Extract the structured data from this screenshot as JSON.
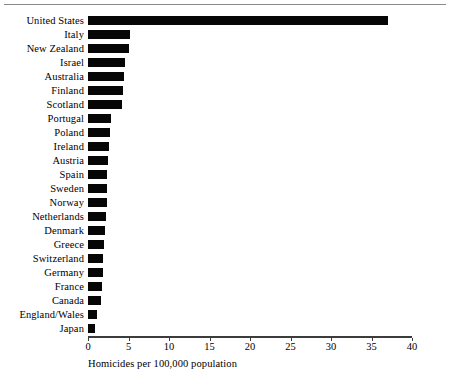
{
  "chart_data": {
    "type": "bar",
    "orientation": "horizontal",
    "title": "",
    "xlabel": "Homicides per 100,000 population",
    "ylabel": "",
    "xlim": [
      0,
      40
    ],
    "xticks": [
      0,
      5,
      10,
      15,
      20,
      25,
      30,
      35,
      40
    ],
    "xtick_labels": [
      "0",
      "5",
      "10",
      "15",
      "20",
      "25",
      "30",
      "35",
      "40"
    ],
    "grid": false,
    "legend": null,
    "bar_color": "#060606",
    "categories": [
      "United States",
      "Italy",
      "New Zealand",
      "Israel",
      "Australia",
      "Finland",
      "Scotland",
      "Portugal",
      "Poland",
      "Ireland",
      "Austria",
      "Spain",
      "Sweden",
      "Norway",
      "Netherlands",
      "Denmark",
      "Greece",
      "Switzerland",
      "Germany",
      "France",
      "Canada",
      "England/Wales",
      "Japan"
    ],
    "values": [
      37.0,
      5.2,
      5.1,
      4.6,
      4.5,
      4.3,
      4.2,
      2.9,
      2.7,
      2.6,
      2.5,
      2.4,
      2.4,
      2.3,
      2.2,
      2.1,
      2.0,
      1.9,
      1.8,
      1.7,
      1.6,
      1.1,
      0.9
    ]
  }
}
